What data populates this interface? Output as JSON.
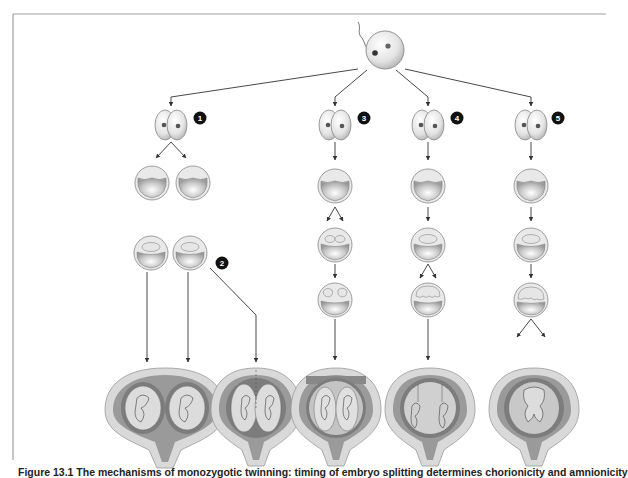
{
  "figure": {
    "caption": "Figure 13.1 The mechanisms of monozygotic twinning: timing of embryo splitting determines chorionicity and amnionicity",
    "caption_visible_fragment": "Figure 13.1 The",
    "frame_color": "#9a9a9a",
    "badge_color": "#111111"
  },
  "zygote": {
    "label": "zygote",
    "has_sperm": true
  },
  "branches": [
    {
      "id": 1,
      "badge": "1",
      "stages": [
        "two-cell",
        "two morulae",
        "two blastocysts"
      ],
      "outcome": "dichorionic diamniotic, separate placentas"
    },
    {
      "id": 2,
      "badge": "2",
      "stages": [
        "two blastocysts"
      ],
      "outcome": "dichorionic diamniotic, fused placenta"
    },
    {
      "id": 3,
      "badge": "3",
      "stages": [
        "two-cell",
        "morula",
        "blastocyst with two inner cell masses",
        "two amniotic cavities"
      ],
      "outcome": "monochorionic diamniotic"
    },
    {
      "id": 4,
      "badge": "4",
      "stages": [
        "two-cell",
        "morula",
        "blastocyst",
        "split embryonic disc"
      ],
      "outcome": "monochorionic monoamniotic"
    },
    {
      "id": 5,
      "badge": "5",
      "stages": [
        "two-cell",
        "morula",
        "blastocyst",
        "incomplete split"
      ],
      "outcome": "conjoined twins"
    }
  ],
  "colors": {
    "cell_fill": "#e6e6e6",
    "cell_stroke": "#888888",
    "nucleus": "#555555",
    "uterus_outer": "#d8d8d8",
    "uterus_wall": "#bdbdbd",
    "decidua": "#8c8c8c",
    "amnion": "#c8c8c8",
    "arrow": "#333333"
  }
}
